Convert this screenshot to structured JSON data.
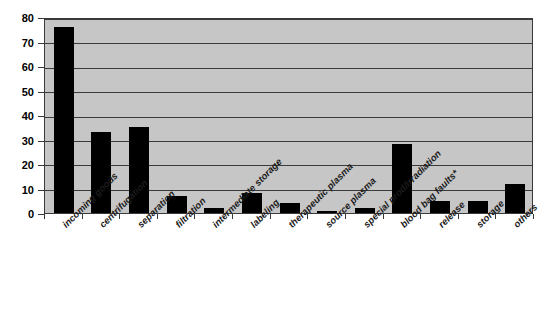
{
  "chart_data": {
    "type": "bar",
    "title": "",
    "subtitle": "",
    "xlabel": "",
    "ylabel": "",
    "ylim": [
      0,
      80
    ],
    "ytick_step": 10,
    "yticks": [
      0,
      10,
      20,
      30,
      40,
      50,
      60,
      70,
      80
    ],
    "grid": "horizontal",
    "legend": "none",
    "categories": [
      "incoming goods",
      "centrifugation",
      "separation",
      "filtration",
      "intermediate storage",
      "labeling",
      "therapeutic plasma",
      "source plasma",
      "special prod/irradiation",
      "blood bag faults*",
      "release",
      "storage",
      "others"
    ],
    "values": [
      76,
      33,
      35,
      7,
      2,
      8,
      4,
      1,
      2,
      28,
      5,
      5,
      12
    ],
    "bar_color": "#000000",
    "plot_background": "#c6c6c6",
    "axis_color": "#3a3a3a",
    "annotation": "*"
  }
}
